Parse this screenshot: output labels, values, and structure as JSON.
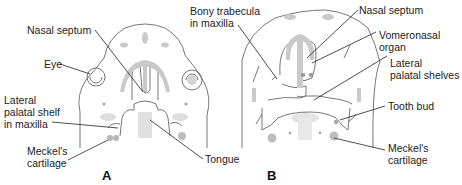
{
  "figure": {
    "panels": [
      {
        "id": "A",
        "letter": "A",
        "labels": {
          "nasal_septum": "Nasal septum",
          "eye": "Eye",
          "lateral_palatal_shelf": "Lateral\npalatal shelf\nin maxilla",
          "meckels_cartilage": "Meckel's\ncartilage",
          "tongue": "Tongue"
        }
      },
      {
        "id": "B",
        "letter": "B",
        "labels": {
          "bony_trabecula": "Bony trabecula\nin maxilla",
          "nasal_septum": "Nasal septum",
          "vomeronasal_organ": "Vomeronasal\norgan",
          "lateral_palatal_shelves": "Lateral\npalatal shelves",
          "tooth_bud": "Tooth bud",
          "meckels_cartilage": "Meckel's\ncartilage"
        }
      }
    ],
    "colors": {
      "outline": "#555555",
      "tissue_fill": "#c8c8c8",
      "light_fill": "#e2e2e2",
      "leader": "#222222"
    }
  }
}
